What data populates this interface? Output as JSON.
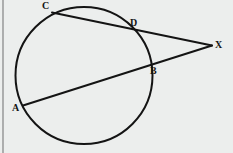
{
  "figure": {
    "kind": "geometry-diagram",
    "background_color": "#eceeed",
    "stroke_color": "#141414",
    "label_color": "#141414",
    "canvas": {
      "width": 233,
      "height": 153
    },
    "left_border": {
      "x": 3,
      "y1": 0,
      "y2": 153,
      "color": "#9d9d9d",
      "width": 1.6
    },
    "circle": {
      "cx": 84,
      "cy": 75.5,
      "r": 68.5,
      "stroke_width": 2.0
    },
    "points": {
      "A": {
        "x": 23,
        "y": 105.5,
        "label": "A",
        "label_x": 12,
        "label_y": 103
      },
      "B": {
        "x": 148,
        "y": 63.5,
        "label": "B",
        "label_x": 150,
        "label_y": 66
      },
      "C": {
        "x": 52,
        "y": 12.5,
        "label": "C",
        "label_x": 42,
        "label_y": 1
      },
      "D": {
        "x": 129,
        "y": 31,
        "label": "D",
        "label_x": 130,
        "label_y": 18
      },
      "X": {
        "x": 212,
        "y": 45.5,
        "label": "X",
        "label_x": 215,
        "label_y": 40
      }
    },
    "segments": [
      {
        "name": "secant-CDX",
        "from": "C",
        "to": "X",
        "stroke_width": 2.0
      },
      {
        "name": "secant-ABX",
        "from": "A",
        "to": "X",
        "stroke_width": 2.0
      }
    ],
    "labels": [
      "C",
      "D",
      "X",
      "B",
      "A"
    ]
  }
}
